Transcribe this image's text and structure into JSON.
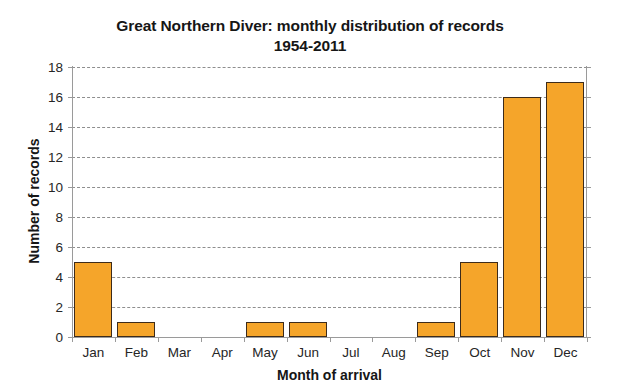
{
  "chart_data": {
    "type": "bar",
    "title": "Great Northern Diver: monthly distribution of records",
    "subtitle": "1954-2011",
    "title_line1": "Great Northern Diver: monthly distribution of records",
    "title_line2": "1954-2011",
    "xlabel": "Month of arrival",
    "ylabel": "Number of records",
    "categories": [
      "Jan",
      "Feb",
      "Mar",
      "Apr",
      "May",
      "Jun",
      "Jul",
      "Aug",
      "Sep",
      "Oct",
      "Nov",
      "Dec"
    ],
    "values": [
      5,
      1,
      0,
      0,
      1,
      1,
      0,
      0,
      1,
      5,
      16,
      17
    ],
    "ylim": [
      0,
      18
    ],
    "ytick_labels": [
      "0",
      "2",
      "4",
      "6",
      "8",
      "10",
      "12",
      "14",
      "16",
      "18"
    ],
    "ytick_values": [
      0,
      2,
      4,
      6,
      8,
      10,
      12,
      14,
      16,
      18
    ],
    "grid": "horizontal-dashed",
    "legend": "none",
    "bar_color": "#f5a52a",
    "bar_border_color": "#3d2b1a",
    "grid_color": "#8e8e8e",
    "axis_color": "#9a9a9a",
    "background_color": "#ffffff"
  }
}
